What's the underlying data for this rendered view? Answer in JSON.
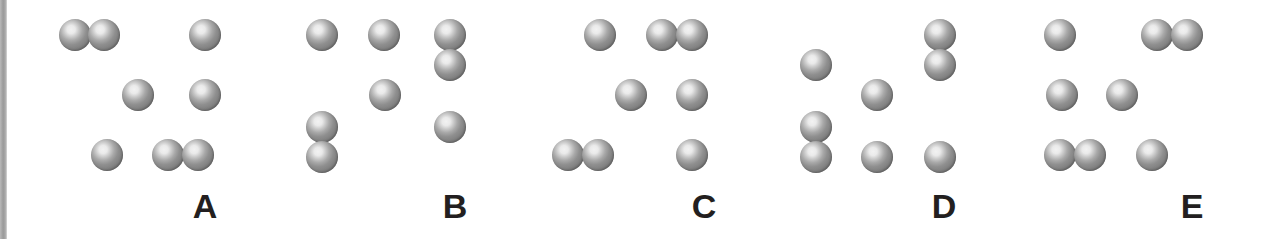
{
  "figure": {
    "width": 1262,
    "height": 239,
    "background_color": "#ffffff",
    "dot_color": "#7e7e7e",
    "dot_highlight_color": "#f2f2f2",
    "label_color": "#231f20",
    "left_rule_color": "#9a9a9a",
    "dot_diameter": 32
  },
  "panels": [
    {
      "label": "A",
      "label_x": 205,
      "label_y": 189,
      "dot_count": 8,
      "dots": [
        {
          "x": 59,
          "y": 19,
          "row": 1,
          "col": 1
        },
        {
          "x": 88,
          "y": 19,
          "row": 1,
          "col": 2
        },
        {
          "x": 189,
          "y": 19,
          "row": 1,
          "col": 5
        },
        {
          "x": 122,
          "y": 79,
          "row": 2,
          "col": 3
        },
        {
          "x": 189,
          "y": 79,
          "row": 2,
          "col": 5
        },
        {
          "x": 91,
          "y": 139,
          "row": 3,
          "col": 2
        },
        {
          "x": 152,
          "y": 139,
          "row": 3,
          "col": 4
        },
        {
          "x": 182,
          "y": 139,
          "row": 3,
          "col": 5
        }
      ]
    },
    {
      "label": "B",
      "label_x": 455,
      "label_y": 189,
      "dot_count": 8,
      "dots": [
        {
          "x": 306,
          "y": 19,
          "row": 1,
          "col": 1
        },
        {
          "x": 368,
          "y": 19,
          "row": 1,
          "col": 3
        },
        {
          "x": 434,
          "y": 19,
          "row": 1,
          "col": 5
        },
        {
          "x": 434,
          "y": 49,
          "row": 1,
          "col": 5
        },
        {
          "x": 369,
          "y": 79,
          "row": 2,
          "col": 3
        },
        {
          "x": 434,
          "y": 111,
          "row": 3,
          "col": 5
        },
        {
          "x": 306,
          "y": 111,
          "row": 3,
          "col": 1
        },
        {
          "x": 306,
          "y": 141,
          "row": 3,
          "col": 1
        }
      ]
    },
    {
      "label": "C",
      "label_x": 704,
      "label_y": 189,
      "dot_count": 8,
      "dots": [
        {
          "x": 584,
          "y": 19,
          "row": 1,
          "col": 2
        },
        {
          "x": 646,
          "y": 19,
          "row": 1,
          "col": 4
        },
        {
          "x": 676,
          "y": 19,
          "row": 1,
          "col": 5
        },
        {
          "x": 615,
          "y": 79,
          "row": 2,
          "col": 3
        },
        {
          "x": 676,
          "y": 79,
          "row": 2,
          "col": 5
        },
        {
          "x": 552,
          "y": 139,
          "row": 3,
          "col": 1
        },
        {
          "x": 582,
          "y": 139,
          "row": 3,
          "col": 2
        },
        {
          "x": 676,
          "y": 139,
          "row": 3,
          "col": 5
        }
      ]
    },
    {
      "label": "D",
      "label_x": 944,
      "label_y": 189,
      "dot_count": 8,
      "dots": [
        {
          "x": 924,
          "y": 19,
          "row": 1,
          "col": 5
        },
        {
          "x": 924,
          "y": 49,
          "row": 1,
          "col": 5
        },
        {
          "x": 800,
          "y": 49,
          "row": 1,
          "col": 1
        },
        {
          "x": 861,
          "y": 79,
          "row": 2,
          "col": 3
        },
        {
          "x": 800,
          "y": 111,
          "row": 3,
          "col": 1
        },
        {
          "x": 800,
          "y": 141,
          "row": 3,
          "col": 1
        },
        {
          "x": 861,
          "y": 141,
          "row": 3,
          "col": 3
        },
        {
          "x": 924,
          "y": 141,
          "row": 3,
          "col": 5
        }
      ]
    },
    {
      "label": "E",
      "label_x": 1192,
      "label_y": 189,
      "dot_count": 8,
      "dots": [
        {
          "x": 1044,
          "y": 19,
          "row": 1,
          "col": 1
        },
        {
          "x": 1141,
          "y": 19,
          "row": 1,
          "col": 4
        },
        {
          "x": 1171,
          "y": 19,
          "row": 1,
          "col": 5
        },
        {
          "x": 1046,
          "y": 79,
          "row": 2,
          "col": 1
        },
        {
          "x": 1106,
          "y": 79,
          "row": 2,
          "col": 3
        },
        {
          "x": 1044,
          "y": 139,
          "row": 3,
          "col": 1
        },
        {
          "x": 1074,
          "y": 139,
          "row": 3,
          "col": 2
        },
        {
          "x": 1136,
          "y": 139,
          "row": 3,
          "col": 3
        }
      ]
    }
  ]
}
